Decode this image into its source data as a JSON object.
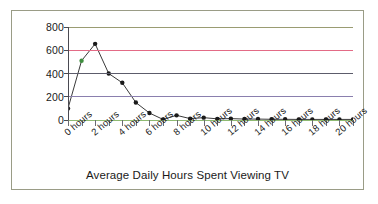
{
  "chart_data": {
    "type": "line",
    "title": "",
    "xlabel": "Average Daily Hours Spent Viewing TV",
    "ylabel": "",
    "x": [
      0,
      1,
      2,
      3,
      4,
      5,
      6,
      7,
      8,
      9,
      10,
      11,
      12,
      13,
      14,
      15,
      16,
      17,
      18,
      19,
      20,
      21
    ],
    "values": [
      100,
      510,
      655,
      400,
      320,
      150,
      60,
      5,
      40,
      12,
      20,
      10,
      12,
      8,
      8,
      6,
      6,
      5,
      5,
      5,
      5,
      5
    ],
    "xtick_labels": [
      "0 hours",
      "2 hours",
      "4 hours",
      "6 hours",
      "8 hours",
      "10 hours",
      "12 hours",
      "14 hours",
      "16 hours",
      "18 hours",
      "20 hours"
    ],
    "xtick_label_indices": [
      0,
      2,
      4,
      6,
      8,
      10,
      12,
      14,
      16,
      18,
      20
    ],
    "ytick_labels": [
      "800",
      "600",
      "400",
      "200",
      "0"
    ],
    "ytick_values": [
      800,
      600,
      400,
      200,
      0
    ],
    "ylim": [
      0,
      800
    ],
    "xlim": [
      0,
      21
    ],
    "grid": true,
    "legend": false,
    "marker": "filled-circle",
    "gridline_colors": {
      "800": "#9a9c72",
      "600": "#e36b86",
      "400": "#5c5c6b",
      "200": "#8a7fae",
      "0": "#8fba72"
    },
    "line_color": "#3a3a3a",
    "marker_color": "#1a1a1a",
    "marker_highlight_color": "#3f8f3f",
    "marker_highlight_indices": [
      1
    ],
    "axis_color": "#4a4a52",
    "frame_color": "#9a9c86",
    "background": "#ffffff"
  }
}
